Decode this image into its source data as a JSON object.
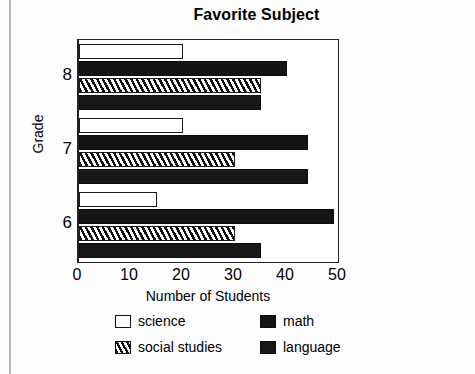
{
  "chart_data": {
    "type": "bar",
    "orientation": "horizontal",
    "title": "Favorite Subject",
    "xlabel": "Number of Students",
    "ylabel": "Grade",
    "categories": [
      "6",
      "7",
      "8"
    ],
    "xlim": [
      0,
      50
    ],
    "xticks": [
      0,
      10,
      20,
      30,
      40,
      50
    ],
    "xtick_labels": [
      "0",
      "10",
      "20",
      "30",
      "40",
      "50"
    ],
    "grid": false,
    "legend_position": "below",
    "series": [
      {
        "name": "science",
        "values": [
          15,
          20,
          20
        ],
        "color": "#ffffff",
        "pattern": "solid-outline"
      },
      {
        "name": "social studies",
        "values": [
          30,
          30,
          35
        ],
        "color": "#ffffff",
        "pattern": "diagonal-hatch"
      },
      {
        "name": "math",
        "values": [
          49,
          44,
          40
        ],
        "color": "#141414",
        "pattern": "solid-fill"
      },
      {
        "name": "language",
        "values": [
          35,
          44,
          35
        ],
        "color": "#171717",
        "pattern": "solid-fill"
      }
    ]
  },
  "legend": {
    "items": [
      {
        "label": "science"
      },
      {
        "label": "math"
      },
      {
        "label": "social studies"
      },
      {
        "label": "language"
      }
    ]
  }
}
